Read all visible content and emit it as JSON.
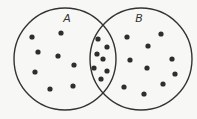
{
  "diagram": {
    "type": "venn",
    "colors": {
      "background": "#f7f7f5",
      "stroke": "#333333",
      "dot": "#2e2e2e"
    },
    "sets": [
      {
        "id": "A",
        "label": "A",
        "cx": 65,
        "cy": 59,
        "r": 51,
        "label_x": 67,
        "label_y": 22
      },
      {
        "id": "B",
        "label": "B",
        "cx": 141,
        "cy": 59,
        "r": 51,
        "label_x": 139,
        "label_y": 22
      }
    ],
    "regions": {
      "A_only": {
        "count": 8,
        "points": [
          [
            32,
            37
          ],
          [
            61,
            33
          ],
          [
            38,
            52
          ],
          [
            58,
            56
          ],
          [
            74,
            65
          ],
          [
            35,
            72
          ],
          [
            50,
            89
          ],
          [
            73,
            86
          ]
        ]
      },
      "A_and_B": {
        "count": 7,
        "points": [
          [
            98,
            39
          ],
          [
            107,
            47
          ],
          [
            97,
            54
          ],
          [
            103,
            59
          ],
          [
            94,
            68
          ],
          [
            107,
            71
          ],
          [
            101,
            79
          ]
        ]
      },
      "B_only": {
        "count": 10,
        "points": [
          [
            127,
            37
          ],
          [
            161,
            34
          ],
          [
            148,
            46
          ],
          [
            130,
            60
          ],
          [
            147,
            68
          ],
          [
            172,
            59
          ],
          [
            175,
            74
          ],
          [
            163,
            84
          ],
          [
            124,
            87
          ],
          [
            144,
            94
          ]
        ]
      }
    },
    "dot_radius": 2.6
  }
}
